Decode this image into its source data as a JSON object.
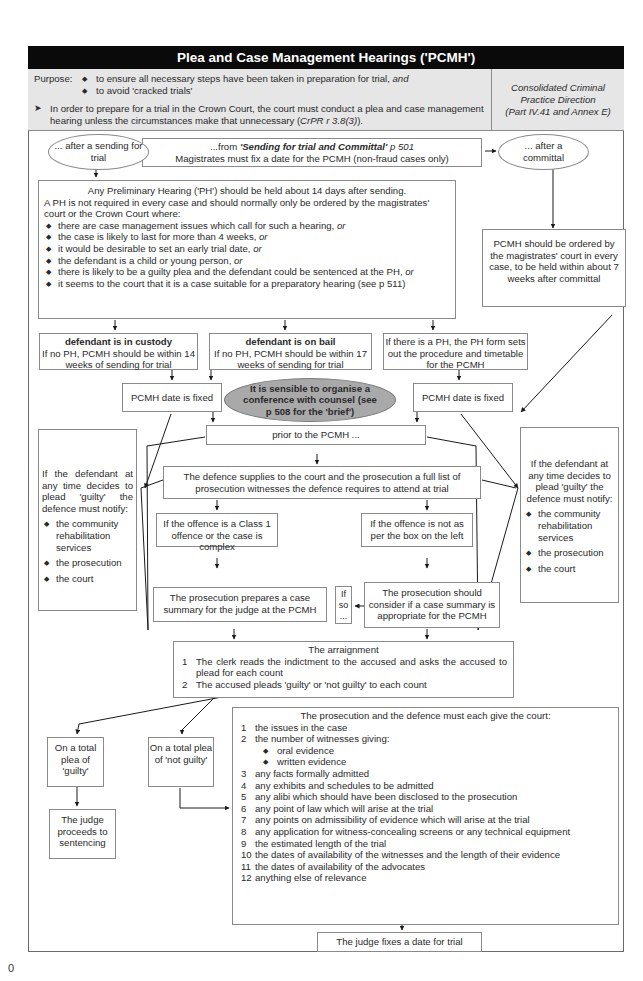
{
  "title": "Plea and Case Management Hearings ('PCMH')",
  "purpose": {
    "label": "Purpose:",
    "bullets": [
      {
        "text": "to ensure all necessary steps have been taken in preparation for trial, ",
        "em": "and"
      },
      {
        "text": "to avoid 'cracked trials'",
        "em": ""
      }
    ],
    "arrow_text": "In order to prepare for a trial in the Crown Court, the court must conduct a plea and case management hearing unless the circumstances make that unnecessary (",
    "arrow_cite": "CrPR r 3.8(3)",
    "arrow_end": ")."
  },
  "citation": {
    "line1": "Consolidated Criminal",
    "line2": "Practice Direction",
    "line3": "(Part IV.41 and Annex E)"
  },
  "start": {
    "from_prefix": "...from ",
    "from_link": "'Sending for trial and Committal'",
    "from_page": " p 501",
    "line2": "Magistrates must fix a date for the PCMH (non-fraud cases only)"
  },
  "branch_left": "... after a sending for trial",
  "branch_right": "... after a committal",
  "ph_box": {
    "line1": "Any Preliminary Hearing ('PH') should be held about 14 days after sending.",
    "line2": "A PH is not required in every case and should normally only be ordered by the magistrates' court or the Crown Court where:",
    "bullets": [
      {
        "text": "there are case management issues which call for such a hearing, ",
        "em": "or"
      },
      {
        "text": "the case is likely to last for more than 4 weeks, ",
        "em": "or"
      },
      {
        "text": "it would be desirable to set an early trial date, ",
        "em": "or"
      },
      {
        "text": "the defendant is a child or young person, ",
        "em": "or"
      },
      {
        "text": "there is likely to be a guilty plea and the defendant could be sentenced at the PH, ",
        "em": "or"
      },
      {
        "text": "it seems to the court that it is a case suitable for a preparatory hearing (see p 511)",
        "em": ""
      }
    ]
  },
  "committal_box": "PCMH should be ordered by the magistrates' court in every case, to be held within about 7 weeks after committal",
  "custody_box": {
    "title": "defendant is in custody",
    "body": "If no PH, PCMH should be within 14 weeks of sending for trial"
  },
  "bail_box": {
    "title": "defendant is on bail",
    "body": "If no PH, PCMH should be within 17 weeks of sending for trial"
  },
  "ph_form_box": "If there is a PH, the PH form sets out the procedure and timetable for the PCMH",
  "date_fixed_left": "PCMH date is fixed",
  "date_fixed_right": "PCMH date is fixed",
  "counsel_note": "It is sensible to organise a conference with counsel (see p 508 for the 'brief')",
  "prior_box": "prior to the PCMH ...",
  "guilty_notice": {
    "intro": "If the defendant at any time decides to plead 'guilty' the defence must notify:",
    "bullets": [
      "the community rehabilitation services",
      "the prosecution",
      "the court"
    ]
  },
  "witness_box": "The defence supplies to the court and the prosecution a full list of prosecution witnesses the defence requires to attend at trial",
  "class1_box": "If the offence is a Class 1 offence or the case is complex",
  "notclass1_box": "If the offence is not as per the box on the left",
  "case_summary_box": "The prosecution prepares a case summary for the judge at the PCMH",
  "if_so": {
    "l1": "If",
    "l2": "so",
    "l3": "..."
  },
  "consider_box": "The prosecution should consider if a case summary is appropriate for the PCMH",
  "arraignment": {
    "title": "The arraignment",
    "items": [
      {
        "n": "1",
        "text": "The clerk reads the indictment to the accused and asks the accused to plead for each count"
      },
      {
        "n": "2",
        "text": "The accused pleads 'guilty' or 'not guilty' to each count"
      }
    ]
  },
  "plea_guilty": "On a total plea of 'guilty'",
  "plea_not_guilty": "On a total plea of 'not guilty'",
  "sentencing": "The judge proceeds to sentencing",
  "must_give": {
    "title": "The prosecution and the defence must each give the court:",
    "items": [
      {
        "n": "1",
        "text": "the issues in the case"
      },
      {
        "n": "2",
        "text": "the number of witnesses giving:",
        "sub": [
          "oral evidence",
          "written evidence"
        ]
      },
      {
        "n": "3",
        "text": "any facts formally admitted"
      },
      {
        "n": "4",
        "text": "any exhibits and schedules to be admitted"
      },
      {
        "n": "5",
        "text": "any alibi which should have been disclosed to the prosecution"
      },
      {
        "n": "6",
        "text": "any point of law which will arise at the trial"
      },
      {
        "n": "7",
        "text": "any points on admissibility of evidence which will arise at the trial"
      },
      {
        "n": "8",
        "text": "any application for witness-concealing screens or any technical equipment"
      },
      {
        "n": "9",
        "text": "the estimated length of the trial"
      },
      {
        "n": "10",
        "text": "the dates of availability of the witnesses and the length of their evidence"
      },
      {
        "n": "11",
        "text": "the dates of availability of the advocates"
      },
      {
        "n": "12",
        "text": "anything else of relevance"
      }
    ]
  },
  "trial_date": "The judge fixes a date for trial",
  "page_number": "0",
  "colors": {
    "header_bg": "#0a0a0a",
    "purpose_bg": "#e6e6e6",
    "ellipse_grey": "#a9a9a9",
    "border": "#8a8a8a"
  }
}
